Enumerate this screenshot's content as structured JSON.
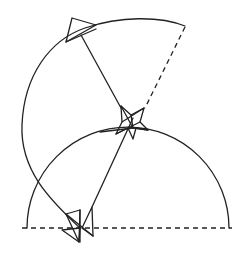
{
  "diagram": {
    "colors": {
      "stroke": "#222222",
      "background": "#ffffff"
    },
    "baseline": {
      "x1": 22,
      "y1": 228,
      "x2": 232,
      "y2": 228,
      "style": "dashed"
    },
    "lower_semicircle": {
      "cx": 128,
      "cy": 228,
      "r": 101
    },
    "upper_arc": {
      "start": [
        78,
        225
      ],
      "end": [
        185,
        26
      ],
      "radius": 110,
      "pivot": [
        133,
        118
      ]
    },
    "dashed_radius": {
      "x1": 185,
      "y1": 26,
      "x2": 144,
      "y2": 108
    },
    "solid_radius_top": {
      "x1": 121,
      "y1": 108,
      "x2": 81,
      "y2": 35
    },
    "connector": {
      "x1": 133,
      "y1": 118,
      "x2": 92,
      "y2": 206
    },
    "markers": [
      {
        "name": "top-triangle",
        "points": "72,18 96,25 66,42"
      },
      {
        "name": "pivot-star",
        "center": [
          133,
          118
        ]
      },
      {
        "name": "bottom-triangles",
        "center": [
          80,
          228
        ]
      }
    ]
  }
}
